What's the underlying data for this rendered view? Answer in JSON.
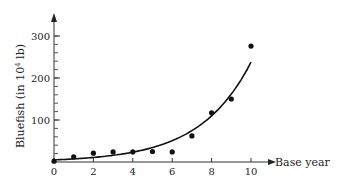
{
  "chart_data": {
    "type": "scatter",
    "title": "",
    "xlabel": "Base year",
    "ylabel": "Bluefish (in 10^4 lb)",
    "ylabel_parts": {
      "pre": "Bluefish (in 10",
      "sup": "4",
      "post": " lb)"
    },
    "xlim": [
      0,
      11
    ],
    "ylim": [
      0,
      330
    ],
    "x_ticks": [
      0,
      2,
      4,
      6,
      8,
      10
    ],
    "x_tick_labels": [
      "0",
      "2",
      "4",
      "6",
      "8",
      "10"
    ],
    "y_ticks": [
      100,
      200,
      300
    ],
    "y_tick_labels": [
      "100",
      "200",
      "300"
    ],
    "y_minor_step": 20,
    "grid": false,
    "legend": null,
    "series": [
      {
        "name": "observed",
        "kind": "points",
        "x": [
          0,
          1,
          2,
          3,
          4,
          5,
          6,
          7,
          8,
          9,
          10
        ],
        "y": [
          2,
          12,
          21,
          24,
          24,
          25,
          24,
          62,
          117,
          150,
          276
        ]
      },
      {
        "name": "exponential fit",
        "kind": "curve",
        "x": [
          0,
          1,
          2,
          3,
          4,
          5,
          6,
          7,
          8,
          9,
          10
        ],
        "y": [
          5,
          7.4,
          11,
          16.3,
          24.2,
          35.9,
          53.3,
          79,
          117,
          174,
          238
        ]
      }
    ]
  }
}
